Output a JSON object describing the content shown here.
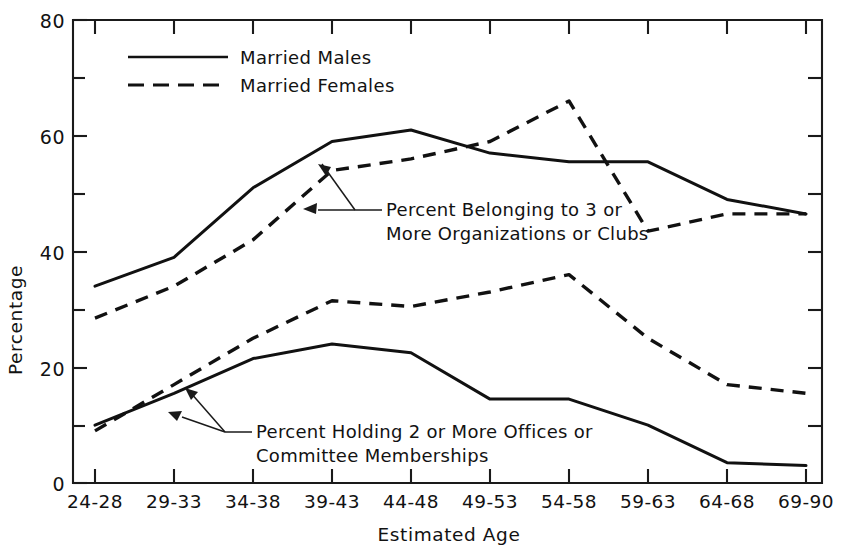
{
  "chart_data": {
    "type": "line",
    "title": "",
    "xlabel": "Estimated Age",
    "ylabel": "Percentage",
    "categories": [
      "24-28",
      "29-33",
      "34-38",
      "39-43",
      "44-48",
      "49-53",
      "54-58",
      "59-63",
      "64-68",
      "69-90"
    ],
    "ylim": [
      0,
      80
    ],
    "yticks_major": [
      0,
      20,
      40,
      60,
      80
    ],
    "yticks_minor": [
      10,
      30,
      50,
      70
    ],
    "grid": false,
    "legend_position": "upper-left-inside",
    "series": [
      {
        "name": "Married Males",
        "group": "Percent Belonging to 3 or More Organizations or Clubs",
        "style": "solid",
        "values": [
          34,
          39,
          51,
          59,
          61,
          57,
          55.5,
          55.5,
          49,
          46.5
        ]
      },
      {
        "name": "Married Females",
        "group": "Percent Belonging to 3 or More Organizations or Clubs",
        "style": "dashed",
        "values": [
          28.5,
          34,
          42,
          54,
          56,
          59,
          66,
          43.5,
          46.5,
          46.5
        ]
      },
      {
        "name": "Married Males",
        "group": "Percent Holding 2 or More Offices or Committee Memberships",
        "style": "solid",
        "values": [
          10,
          15.5,
          21.5,
          24,
          22.5,
          14.5,
          14.5,
          10,
          3.5,
          3
        ]
      },
      {
        "name": "Married Females",
        "group": "Percent Holding 2 or More Offices or Committee Memberships",
        "style": "dashed",
        "values": [
          9,
          17,
          25,
          31.5,
          30.5,
          33,
          36,
          25,
          17,
          15.5
        ]
      }
    ]
  },
  "legend": {
    "entries": [
      {
        "label": "Married Males",
        "style": "solid"
      },
      {
        "label": "Married Females",
        "style": "dashed"
      }
    ]
  },
  "annotations": [
    {
      "id": "upper",
      "line1": "Percent Belonging to 3 or",
      "line2": "More Organizations or Clubs"
    },
    {
      "id": "lower",
      "line1": "Percent Holding 2 or More Offices or",
      "line2": "Committee Memberships"
    }
  ],
  "axes": {
    "y_tick_labels": [
      "80",
      "60",
      "40",
      "20",
      "0"
    ],
    "y_axis_title": "Percentage",
    "x_axis_title": "Estimated Age",
    "x_tick_labels": [
      "24-28",
      "29-33",
      "34-38",
      "39-43",
      "44-48",
      "49-53",
      "54-58",
      "59-63",
      "64-68",
      "69-90"
    ]
  },
  "colors": {
    "ink": "#111111",
    "background": "#ffffff"
  }
}
